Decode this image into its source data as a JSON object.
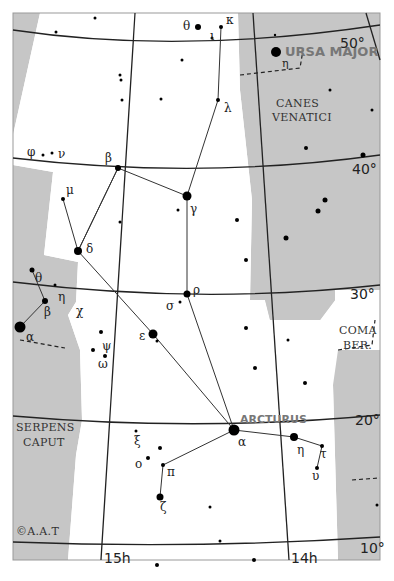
{
  "map": {
    "constellation": "Boötes",
    "colors": {
      "background": "#ffffff",
      "outside": "#c8c8c8",
      "lines": "#222222",
      "stars": "#000000"
    },
    "copyright": "©A.A.T",
    "neighbor_constellations": {
      "ursa_major": "URSA MAJOR",
      "canes_venatici_1": "CANES",
      "canes_venatici_2": "VENATICI",
      "coma_ber_1": "COMA",
      "coma_ber_2": "BER.",
      "serpens_1": "SERPENS",
      "serpens_2": "CAPUT"
    },
    "declination_labels": {
      "d50": "50°",
      "d40": "40°",
      "d30": "30°",
      "d20": "20°",
      "d10": "10°"
    },
    "ra_labels": {
      "h15": "15h",
      "h14": "14h"
    },
    "named_star": "ARCTURUS",
    "star_labels": {
      "theta": "θ",
      "kappa": "κ",
      "iota": "ι",
      "lambda": "λ",
      "beta": "β",
      "gamma": "γ",
      "phi": "φ",
      "nu": "ν",
      "mu": "μ",
      "delta": "δ",
      "rho": "ρ",
      "sigma": "σ",
      "epsilon": "ε",
      "alpha": "α",
      "eta": "η",
      "tau": "τ",
      "upsilon": "υ",
      "xi": "ξ",
      "omicron": "ο",
      "pi": "π",
      "zeta": "ζ",
      "psi": "ψ",
      "omega": "ω",
      "chi": "χ",
      "crb_theta": "θ",
      "crb_beta": "β",
      "crb_eta": "η",
      "crb_alpha": "α",
      "uma_eta": "η"
    }
  }
}
